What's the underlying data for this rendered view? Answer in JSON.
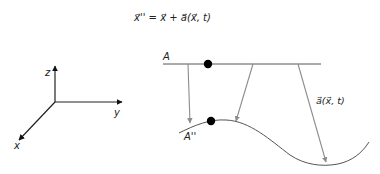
{
  "equation": {
    "text": "x⃗'' = x⃗ + a⃗(x⃗, t)",
    "lhs": "x⃗''",
    "eq": "=",
    "rhs1": "x⃗",
    "plus": "+",
    "rhs2": "a⃗(x⃗, t)"
  },
  "axes": {
    "z_label": "z",
    "y_label": "y",
    "x_label": "x"
  },
  "mapping": {
    "source_label": "A",
    "target_label": "A''",
    "vector_label": "a⃗(x⃗, t)"
  },
  "colors": {
    "axis": "#222222",
    "arrow": "#8c8c8c",
    "line": "#555555",
    "dot": "#000000"
  }
}
